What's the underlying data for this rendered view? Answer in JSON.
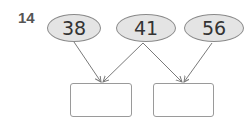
{
  "question_number": "14",
  "numbers": [
    {
      "label": "38"
    },
    {
      "label": "41"
    },
    {
      "label": "56"
    }
  ],
  "answer_boxes": [
    {
      "value": ""
    },
    {
      "value": ""
    }
  ],
  "colors": {
    "oval_fill": "#e4e4e4",
    "oval_stroke": "#8a8a8a",
    "arrow": "#7a7a7a",
    "box_stroke": "#9a9a9a"
  }
}
